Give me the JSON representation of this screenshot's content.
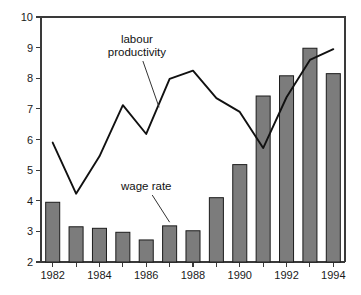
{
  "chart_data": {
    "type": "bar",
    "title": "",
    "subtitle": "",
    "xlabel": "",
    "ylabel": "",
    "grid": false,
    "legend_position": "inline-annotations",
    "x": [
      1982,
      1983,
      1984,
      1985,
      1986,
      1987,
      1988,
      1989,
      1990,
      1991,
      1992,
      1993,
      1994
    ],
    "categories": [
      "1982",
      "1983",
      "1984",
      "1985",
      "1986",
      "1987",
      "1988",
      "1989",
      "1990",
      "1991",
      "1992",
      "1993",
      "1994"
    ],
    "xlim": [
      1981.5,
      1994.5
    ],
    "ylim": [
      2,
      10
    ],
    "yticks": [
      2,
      3,
      4,
      5,
      6,
      7,
      8,
      9,
      10
    ],
    "ytick_labels": [
      "2",
      "3",
      "4",
      "5",
      "6",
      "7",
      "8",
      "9",
      "10"
    ],
    "xticks": [
      1982,
      1983,
      1984,
      1985,
      1986,
      1987,
      1988,
      1989,
      1990,
      1991,
      1992,
      1993,
      1994
    ],
    "xtick_labels": [
      "1982",
      "",
      "1984",
      "",
      "1986",
      "",
      "1988",
      "",
      "1990",
      "",
      "1992",
      "",
      "1994"
    ],
    "xtick_labels_shown": [
      "1982",
      "1984",
      "1986",
      "1988",
      "1990",
      "1992",
      "1994"
    ],
    "series": [
      {
        "name": "wage rate",
        "type": "bar",
        "color": "#7c7c7c",
        "edge_color": "#1c1c1c",
        "values": [
          3.95,
          3.15,
          3.1,
          2.97,
          2.72,
          3.18,
          3.02,
          4.1,
          5.18,
          7.42,
          8.08,
          8.98,
          8.15
        ]
      },
      {
        "name": "labour productivity",
        "type": "line",
        "color": "#111111",
        "values": [
          5.9,
          4.23,
          5.45,
          7.12,
          6.18,
          7.98,
          8.25,
          7.35,
          6.9,
          5.72,
          7.38,
          8.6,
          8.95
        ]
      }
    ],
    "annotations": [
      {
        "id": "labour-productivity-annotation",
        "text_lines": [
          "labour",
          "productivity"
        ],
        "text": "labour productivity",
        "text_x": 1985.6,
        "text_y": 9.15,
        "target_x": 1986.55,
        "target_y": 7.05
      },
      {
        "id": "wage-rate-annotation",
        "text_lines": [
          "wage rate"
        ],
        "text": "wage rate",
        "text_x": 1986.0,
        "text_y": 4.35,
        "target_x": 1987.0,
        "target_y": 3.3
      }
    ]
  },
  "axes": {
    "y_axis_name": "value-axis",
    "x_axis_name": "year-axis"
  }
}
